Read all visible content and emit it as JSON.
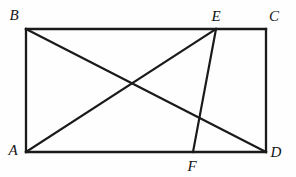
{
  "figure": {
    "type": "geometry-diagram",
    "background_color": "#fefefe",
    "stroke_color": "#1a1a1a",
    "canvas": {
      "width": 296,
      "height": 177
    },
    "points": [
      {
        "id": "A",
        "label": "A",
        "x": 26,
        "y": 152,
        "label_x": 13,
        "label_y": 150,
        "role": "rectangle-vertex-bottom-left"
      },
      {
        "id": "B",
        "label": "B",
        "x": 26,
        "y": 29,
        "label_x": 14,
        "label_y": 15,
        "role": "rectangle-vertex-top-left"
      },
      {
        "id": "C",
        "label": "C",
        "x": 266,
        "y": 29,
        "label_x": 274,
        "label_y": 16,
        "role": "rectangle-vertex-top-right"
      },
      {
        "id": "D",
        "label": "D",
        "x": 266,
        "y": 152,
        "label_x": 276,
        "label_y": 152,
        "role": "rectangle-vertex-bottom-right"
      },
      {
        "id": "E",
        "label": "E",
        "x": 216,
        "y": 29,
        "label_x": 216,
        "label_y": 16,
        "role": "point-on-top-edge"
      },
      {
        "id": "F",
        "label": "F",
        "x": 193,
        "y": 152,
        "label_x": 192,
        "label_y": 166,
        "role": "point-on-bottom-edge"
      }
    ],
    "segments": [
      {
        "id": "AB",
        "name": "left-edge",
        "from": "A",
        "to": "B",
        "kind": "edge"
      },
      {
        "id": "BC",
        "name": "top-edge",
        "from": "B",
        "to": "C",
        "kind": "edge"
      },
      {
        "id": "CD",
        "name": "right-edge",
        "from": "C",
        "to": "D",
        "kind": "edge"
      },
      {
        "id": "DA",
        "name": "bottom-edge",
        "from": "D",
        "to": "A",
        "kind": "edge"
      },
      {
        "id": "BD",
        "name": "diagonal-bd",
        "from": "B",
        "to": "D",
        "kind": "diagonal"
      },
      {
        "id": "AE",
        "name": "diagonal-ae",
        "from": "A",
        "to": "E",
        "kind": "diagonal"
      },
      {
        "id": "EF",
        "name": "cevian-ef",
        "from": "E",
        "to": "F",
        "kind": "cevian"
      }
    ],
    "intersections": [
      {
        "id": "P1",
        "of": [
          "BD",
          "AE"
        ],
        "x": 131,
        "y": 84
      },
      {
        "id": "P2",
        "of": [
          "BD",
          "EF"
        ],
        "x": 200,
        "y": 118
      }
    ]
  }
}
